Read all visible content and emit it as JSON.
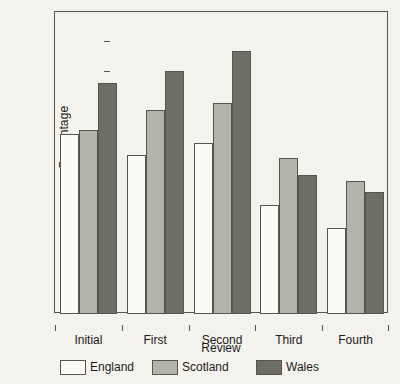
{
  "chart_data": {
    "type": "bar",
    "title": "",
    "subtitle": "",
    "xlabel": "Review",
    "ylabel": "Percentage",
    "categories": [
      "Initial",
      "First",
      "Second",
      "Third",
      "Fourth"
    ],
    "series": [
      {
        "name": "England",
        "color": "#fbfaf5",
        "values": [
          11.9,
          10.5,
          11.3,
          7.2,
          5.7
        ]
      },
      {
        "name": "Scotland",
        "color": "#b3b2ab",
        "values": [
          12.2,
          13.5,
          14.0,
          10.3,
          8.8
        ]
      },
      {
        "name": "Wales",
        "color": "#6e6d66",
        "values": [
          15.3,
          16.1,
          17.4,
          9.2,
          8.1
        ]
      }
    ],
    "ylim": [
      0,
      20
    ],
    "yticks": [
      0,
      2,
      4,
      6,
      8,
      10,
      12,
      14,
      16,
      18,
      20
    ],
    "ytick_labels": [
      "0",
      "2",
      "4",
      "6",
      "8",
      "10",
      "12",
      "14",
      "16",
      "18",
      "20"
    ],
    "grid": false,
    "legend_position": "bottom",
    "legend_entries": [
      "England",
      "Scotland",
      "Wales"
    ],
    "annotations": []
  },
  "colors": {
    "background": "#f3f2ec",
    "axis": "#55544e",
    "text": "#1c1b18",
    "england": "#fbfaf5",
    "scotland": "#b3b2ab",
    "wales": "#6e6d66"
  }
}
